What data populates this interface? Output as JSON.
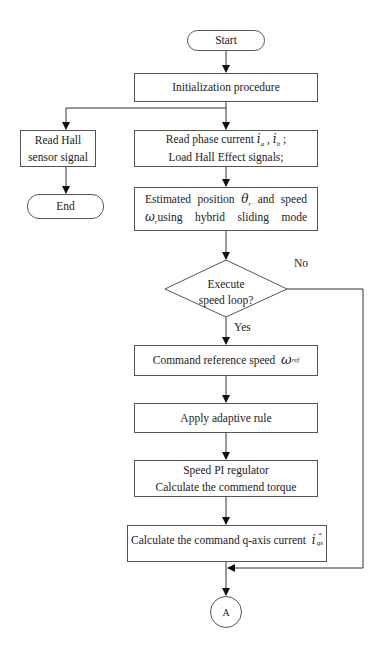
{
  "flowchart": {
    "start": {
      "label": "Start"
    },
    "init": {
      "label": "Initialization procedure"
    },
    "read_hall": {
      "line1": "Read Hall",
      "line2": "sensor signal"
    },
    "end": {
      "label": "End"
    },
    "read_phase": {
      "line1_prefix": "Read phase current",
      "var_a": "i",
      "sub_a": "a",
      "sep": " , ",
      "var_b": "i",
      "sub_b": "b",
      "line1_suffix": " ;",
      "line2": "Load  Hall Effect signals;"
    },
    "estimate": {
      "w1": "Estimated",
      "w2": "position",
      "theta": "θ",
      "theta_sub": "r",
      "w3": "and",
      "w4": "speed",
      "omega": "ω",
      "omega_sub": "r",
      "w5": "using",
      "w6": "hybrid",
      "w7": "sliding",
      "w8": "mode"
    },
    "decision": {
      "line1": "Execute",
      "line2": "speed loop?",
      "yes": "Yes",
      "no": "No"
    },
    "command_ref": {
      "label": "Command reference speed",
      "omega": "ω",
      "sub": "ref"
    },
    "adaptive": {
      "label": "Apply adaptive rule"
    },
    "pi": {
      "line1": "Speed PI regulator",
      "line2": "Calculate the commend torque"
    },
    "q_axis": {
      "label": "Calculate the command q-axis current",
      "var": "i",
      "sup": "*",
      "sub": "qs"
    },
    "connector": {
      "label": "A"
    }
  },
  "colors": {
    "line": "#333333",
    "border": "#555555",
    "background": "#ffffff"
  }
}
